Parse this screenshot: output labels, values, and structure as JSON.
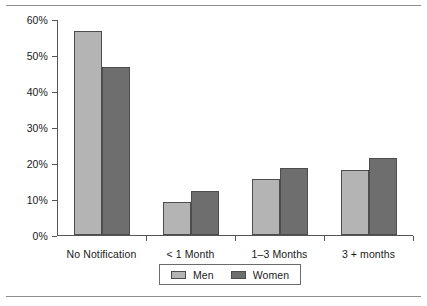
{
  "chart_data": {
    "type": "bar",
    "title": "",
    "subtitle": "",
    "xlabel": "",
    "ylabel": "",
    "categories": [
      "No Notification",
      "< 1 Month",
      "1–3 Months",
      "3 + months"
    ],
    "series": [
      {
        "name": "Men",
        "color": "#b4b4b4",
        "values": [
          56.8,
          9.2,
          15.5,
          18.0
        ]
      },
      {
        "name": "Women",
        "color": "#6e6e6e",
        "values": [
          46.6,
          12.3,
          18.7,
          21.5
        ]
      }
    ],
    "ylim": [
      0,
      60
    ],
    "ytick_values": [
      0,
      10,
      20,
      30,
      40,
      50,
      60
    ],
    "ytick_labels": [
      "0%",
      "10%",
      "20%",
      "30%",
      "40%",
      "50%",
      "60%"
    ],
    "grid": false,
    "legend_position": "bottom-center",
    "legend_entries": [
      "Men",
      "Women"
    ],
    "annotations": []
  },
  "figure": {
    "axis_color": "#555555",
    "rule_color": "#8e8e8e",
    "bar_edge_color": "#4d4d4d",
    "background": "#ffffff"
  }
}
